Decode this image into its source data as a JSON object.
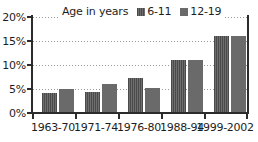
{
  "chart_data": {
    "type": "bar",
    "title": "",
    "xlabel": "",
    "ylabel": "",
    "ylim": [
      0,
      20
    ],
    "yticks": [
      "0%",
      "5%",
      "10%",
      "15%",
      "20%"
    ],
    "ytick_values": [
      0,
      5,
      10,
      15,
      20
    ],
    "grid": true,
    "legend_position": "top-center",
    "legend_title": "Age in years",
    "categories": [
      "1963-70",
      "1971-74",
      "1976-80",
      "1988-94",
      "1999-2002"
    ],
    "series": [
      {
        "name": "6-11",
        "values": [
          4.2,
          4.3,
          7.2,
          11.0,
          16.0
        ],
        "swatch": "series-a"
      },
      {
        "name": "12-19",
        "values": [
          5.1,
          6.0,
          5.2,
          11.0,
          16.0
        ],
        "swatch": "series-b"
      }
    ],
    "colors": {
      "series_a": "#5a5a5a",
      "series_b": "#6a6a6a",
      "axis": "#2b2b2b",
      "gridline": "#9a9a9a",
      "background": "#ffffff",
      "text": "#1d1d1d"
    }
  }
}
